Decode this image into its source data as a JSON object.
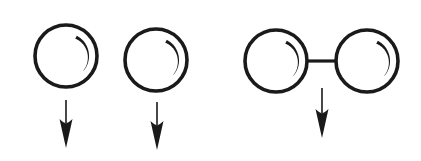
{
  "figure": {
    "background_color": "#ffffff",
    "stroke_color": "#1a1a1a",
    "canvas": {
      "width": 421,
      "height": 161
    }
  },
  "groups": [
    {
      "id": "free-sphere-left",
      "label": "Free sphere left",
      "sphere": {
        "cx": 66,
        "cy": 56,
        "r": 31,
        "stroke_width": 3.6
      },
      "crescent": {
        "cx": 66,
        "cy": 56,
        "r": 23,
        "start_deg": -62,
        "end_deg": 40,
        "max_width": 3.0
      },
      "arrow": {
        "x": 66,
        "y_start": 100,
        "y_tip": 148,
        "shaft_width": 1.6,
        "head_length": 26,
        "head_half_width": 6.5
      }
    },
    {
      "id": "free-sphere-right",
      "label": "Free sphere right",
      "sphere": {
        "cx": 156,
        "cy": 60,
        "r": 31,
        "stroke_width": 3.6
      },
      "crescent": {
        "cx": 156,
        "cy": 60,
        "r": 23,
        "start_deg": -62,
        "end_deg": 40,
        "max_width": 3.0
      },
      "arrow": {
        "x": 157,
        "y_start": 102,
        "y_tip": 150,
        "shaft_width": 1.6,
        "head_length": 26,
        "head_half_width": 6.5
      }
    },
    {
      "id": "dumbbell",
      "label": "Rigid dumbbell of two connected spheres",
      "sphere_a": {
        "cx": 276,
        "cy": 61,
        "r": 31,
        "stroke_width": 3.6
      },
      "sphere_b": {
        "cx": 367,
        "cy": 61,
        "r": 31,
        "stroke_width": 3.6
      },
      "crescent_a": {
        "cx": 276,
        "cy": 61,
        "r": 23,
        "start_deg": -62,
        "end_deg": 40,
        "max_width": 3.0
      },
      "crescent_b": {
        "cx": 367,
        "cy": 61,
        "r": 23,
        "start_deg": -62,
        "end_deg": 40,
        "max_width": 3.0
      },
      "rod": {
        "x1": 307,
        "y1": 61,
        "x2": 336,
        "y2": 61,
        "stroke_width": 3.2
      },
      "arrow": {
        "x": 322,
        "y_start": 88,
        "y_tip": 138,
        "shaft_width": 1.6,
        "head_length": 26,
        "head_half_width": 6.5
      }
    }
  ],
  "annotations": {
    "arrow_meaning": "downward force",
    "sphere_count": 4,
    "arrow_count": 3,
    "rod_count": 1
  }
}
